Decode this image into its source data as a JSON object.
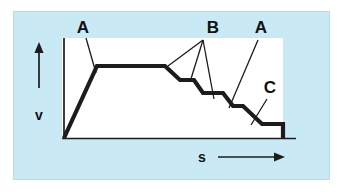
{
  "figure": {
    "type": "diagram",
    "colors": {
      "panel_background": "#c9e9f5",
      "plot_background": "#ffffff",
      "curve": "#1c1c1c",
      "axis": "#1c1c1c",
      "panel_border": "#b6dced"
    },
    "axes": {
      "y_label": "v",
      "x_label": "s",
      "y_arrow": "up-arrow",
      "x_arrow": "right-arrow"
    },
    "callouts": [
      {
        "id": "A-left",
        "label": "A",
        "x": 83,
        "y": 33,
        "target_x": 96,
        "target_y": 72
      },
      {
        "id": "B",
        "label": "B",
        "x": 213,
        "y": 33,
        "target_x": 203,
        "target_y": 40
      },
      {
        "id": "A-right",
        "label": "A",
        "x": 261,
        "y": 33,
        "target_x": 230,
        "target_y": 107
      },
      {
        "id": "C",
        "label": "C",
        "x": 270,
        "y": 93,
        "target_x": 252,
        "target_y": 124
      }
    ],
    "leader_lines": [
      {
        "from": "A-left",
        "x1": 86,
        "y1": 38,
        "x2": 96,
        "y2": 73
      },
      {
        "from": "B",
        "x1": 203,
        "y1": 40,
        "x2": 168,
        "y2": 66
      },
      {
        "from": "B",
        "x1": 203,
        "y1": 40,
        "x2": 190,
        "y2": 82
      },
      {
        "from": "B",
        "x1": 203,
        "y1": 40,
        "x2": 214,
        "y2": 99
      },
      {
        "from": "A-right",
        "x1": 258,
        "y1": 40,
        "x2": 229,
        "y2": 108
      },
      {
        "from": "C",
        "x1": 267,
        "y1": 99,
        "x2": 251,
        "y2": 125
      }
    ],
    "curve_points": [
      {
        "x": 64,
        "y": 138,
        "note": "origin, start of acceleration ramp"
      },
      {
        "x": 97,
        "y": 66,
        "note": "top of ramp (segment A)"
      },
      {
        "x": 165,
        "y": 66,
        "note": "end of constant-velocity plateau"
      },
      {
        "x": 180,
        "y": 80,
        "note": "first drop"
      },
      {
        "x": 194,
        "y": 80,
        "note": "first step tread"
      },
      {
        "x": 203,
        "y": 93,
        "note": "second drop"
      },
      {
        "x": 223,
        "y": 93,
        "note": "second step tread"
      },
      {
        "x": 233,
        "y": 106,
        "note": "third drop"
      },
      {
        "x": 243,
        "y": 106,
        "note": "third step tread"
      },
      {
        "x": 262,
        "y": 124,
        "note": "fourth drop (segment A descent)"
      },
      {
        "x": 283,
        "y": 124,
        "note": "final low plateau (segment C)"
      },
      {
        "x": 283,
        "y": 138,
        "note": "drop to zero at end"
      }
    ],
    "plot_area": {
      "left": 62,
      "top": 38,
      "right": 283,
      "bottom": 138
    },
    "panel": {
      "left": 13,
      "top": 11,
      "width": 317,
      "height": 169
    }
  }
}
